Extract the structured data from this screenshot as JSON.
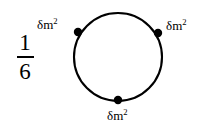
{
  "figure": {
    "name": "circle-with-three-mass-points",
    "background_color": "#ffffff",
    "stroke_color": "#000000",
    "coefficient": {
      "numerator": "1",
      "denominator": "6"
    },
    "circle": {
      "center_x": 118,
      "center_y": 57,
      "radius": 44,
      "stroke_width": 2.1
    },
    "points": [
      {
        "id": "upper-left",
        "cx": 78,
        "cy": 32,
        "r": 4.2,
        "label_base": "δm",
        "label_exponent": "2",
        "label_x": 37,
        "label_y": 18
      },
      {
        "id": "upper-right",
        "cx": 158,
        "cy": 33,
        "r": 4.2,
        "label_base": "δm",
        "label_exponent": "2",
        "label_x": 166,
        "label_y": 19
      },
      {
        "id": "bottom",
        "cx": 118,
        "cy": 100,
        "r": 4.2,
        "label_base": "δm",
        "label_exponent": "2",
        "label_x": 107,
        "label_y": 109
      }
    ]
  }
}
